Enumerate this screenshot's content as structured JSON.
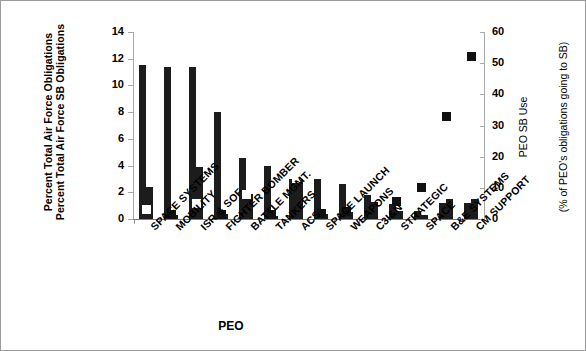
{
  "axis_titles": {
    "left_line1": "Percent Total Air Force Obligations",
    "left_line2": "Percent Total Air Force SB Obligations",
    "right_line1": "PEO SB Use",
    "right_line2": "(% of PEO's obligations going to SB)",
    "x": "PEO"
  },
  "left_ticks": [
    "0",
    "2",
    "4",
    "6",
    "8",
    "10",
    "12",
    "14"
  ],
  "right_ticks": [
    "0",
    "10",
    "20",
    "30",
    "40",
    "50",
    "60"
  ],
  "chart_data": {
    "type": "bar",
    "title": "",
    "xlabel": "PEO",
    "ylabel": "Percent Total Air Force Obligations / Percent Total Air Force SB Obligations",
    "y2label": "PEO SB Use (% of PEO's obligations going to SB)",
    "ylim": [
      0,
      14
    ],
    "y2lim": [
      0,
      60
    ],
    "yticks": [
      0,
      2,
      4,
      6,
      8,
      10,
      12,
      14
    ],
    "y2ticks": [
      0,
      10,
      20,
      30,
      40,
      50,
      60
    ],
    "grid": false,
    "legend": "none",
    "categories": [
      "SPACE SYSTEMS",
      "MOBILITY",
      "ISR & SOF",
      "FIGHTER BOMBER",
      "BATTLE MGMT.",
      "TANKERS",
      "ACS",
      "SPACE LAUNCH",
      "WEAPONS",
      "C3I&N",
      "STRATEGIC",
      "SPACE",
      "B&E SYSTEMS",
      "CM SUPPORT"
    ],
    "series": [
      {
        "name": "Percent Total Air Force Obligations",
        "axis": "left",
        "type": "bar",
        "values": [
          11.5,
          11.4,
          11.4,
          8.0,
          4.6,
          4.0,
          3.0,
          3.0,
          2.6,
          1.8,
          1.1,
          0.6,
          1.2,
          1.2
        ]
      },
      {
        "name": "Percent Total Air Force SB Obligations",
        "axis": "left",
        "type": "bar",
        "values": [
          2.4,
          0.3,
          3.9,
          0.35,
          1.9,
          0.25,
          3.0,
          0.4,
          0.55,
          1.3,
          0.6,
          0.3,
          1.5,
          1.5
        ]
      },
      {
        "name": "PEO SB Use",
        "axis": "right",
        "type": "scatter",
        "values": [
          3.0,
          1.4,
          5.0,
          1.4,
          8.0,
          1.3,
          13.0,
          1.8,
          2.5,
          13.0,
          5.5,
          10.0,
          33.0,
          52.0
        ]
      }
    ]
  }
}
